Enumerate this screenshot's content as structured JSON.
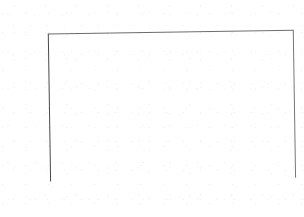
{
  "chart_data": {
    "type": "bar",
    "xlabel": "",
    "ylabel": "Percent",
    "categories": [
      "18-24",
      "25-34",
      "35-44",
      "45-54",
      "55-64",
      "65 & up"
    ],
    "values": [
      80,
      50,
      40,
      35,
      25,
      22
    ],
    "ylim": [
      0,
      100
    ],
    "ytick_labels": [
      "0",
      "20",
      "40",
      "60",
      "80",
      "100"
    ],
    "ytick_values": [
      0,
      20,
      40,
      60,
      80,
      100
    ],
    "minor_gridline_values": [
      10,
      30,
      50,
      70,
      90
    ],
    "grid": true,
    "legend": "none",
    "style": "3d-bar",
    "bar_color": "#6c6c6c",
    "bar_top_color": "#a2a2a2",
    "bar_side_color": "#565656",
    "gridline_color": "#b9b9b9",
    "background_color": "#ffffff",
    "floor_color": "#d9d9d9"
  }
}
